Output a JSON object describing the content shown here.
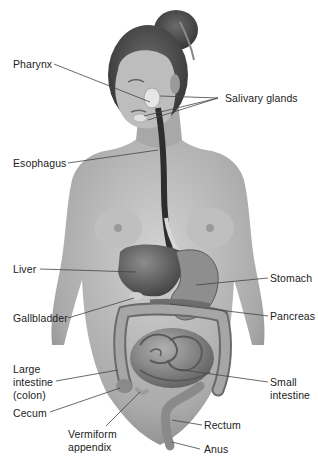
{
  "diagram": {
    "labels": {
      "pharynx": "Pharynx",
      "salivary_glands": "Salivary glands",
      "esophagus": "Esophagus",
      "liver": "Liver",
      "stomach": "Stomach",
      "gallbladder": "Gallbladder",
      "pancreas": "Pancreas",
      "large_intestine_1": "Large",
      "large_intestine_2": "intestine",
      "large_intestine_3": "(colon)",
      "small_intestine_1": "Small",
      "small_intestine_2": "intestine",
      "cecum": "Cecum",
      "rectum": "Rectum",
      "appendix_1": "Vermiform",
      "appendix_2": "appendix",
      "anus": "Anus"
    },
    "colors": {
      "background": "#ffffff",
      "skin": "#b8b8b8",
      "skin_shadow": "#8a8a8a",
      "hair": "#4a4a4a",
      "organ_dark": "#555555",
      "organ_mid": "#7a7a7a",
      "leader_line": "#444444",
      "label_text": "#222222"
    }
  }
}
